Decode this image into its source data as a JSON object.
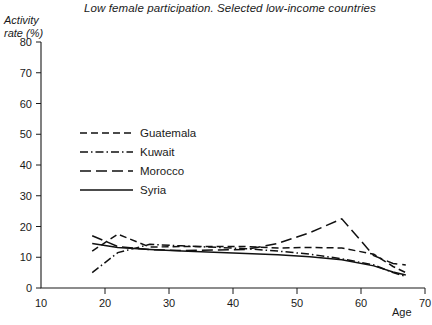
{
  "chart_data": {
    "type": "line",
    "title": "Low female participation. Selected low-income countries",
    "xlabel": "Age",
    "ylabel_line1": "Activity",
    "ylabel_line2": "rate (%)",
    "xlim": [
      10,
      70
    ],
    "ylim": [
      0,
      80
    ],
    "xticks": [
      10,
      20,
      30,
      40,
      50,
      60,
      70
    ],
    "xtick_labels": [
      "10",
      "20",
      "30",
      "40",
      "50",
      "60",
      "70"
    ],
    "yticks": [
      0,
      10,
      20,
      30,
      40,
      50,
      60,
      70,
      80
    ],
    "ytick_labels": [
      "0",
      "10",
      "20",
      "30",
      "40",
      "50",
      "60",
      "70",
      "80"
    ],
    "grid": false,
    "legend_position": "upper-left-inside",
    "series": [
      {
        "name": "Guatemala",
        "style": "short-dash",
        "dasharray": "7,4",
        "x": [
          18,
          22,
          27,
          32,
          42,
          47,
          52,
          57,
          62,
          65,
          67
        ],
        "y": [
          12.0,
          17.5,
          13.3,
          13.5,
          13.5,
          13.0,
          13.2,
          13.0,
          11.0,
          7.0,
          5.0
        ]
      },
      {
        "name": "Kuwait",
        "style": "dash-dot",
        "dasharray": "8,3,1.5,3",
        "x": [
          18,
          22,
          27,
          32,
          42,
          47,
          52,
          57,
          62,
          65,
          67
        ],
        "y": [
          5.0,
          11.5,
          14.2,
          13.7,
          12.8,
          12.0,
          11.0,
          9.5,
          7.5,
          5.0,
          3.8
        ]
      },
      {
        "name": "Morocco",
        "style": "long-dash",
        "dasharray": "11,5",
        "x": [
          18,
          22,
          27,
          32,
          42,
          47,
          52,
          57,
          62,
          65,
          67
        ],
        "y": [
          17.0,
          13.5,
          12.5,
          12.2,
          12.5,
          14.5,
          18.0,
          22.5,
          10.5,
          8.0,
          7.5
        ]
      },
      {
        "name": "Syria",
        "style": "solid",
        "dasharray": "",
        "x": [
          18,
          22,
          27,
          32,
          42,
          47,
          52,
          57,
          62,
          65,
          67
        ],
        "y": [
          14.5,
          13.2,
          12.5,
          12.0,
          11.2,
          10.8,
          10.2,
          9.2,
          7.2,
          5.2,
          4.2
        ]
      }
    ]
  },
  "legend": {
    "items": [
      {
        "label": "Guatemala"
      },
      {
        "label": "Kuwait"
      },
      {
        "label": "Morocco"
      },
      {
        "label": "Syria"
      }
    ]
  },
  "colors": {
    "ink": "#1a1a1a",
    "line": "#111111",
    "background": "#ffffff"
  }
}
